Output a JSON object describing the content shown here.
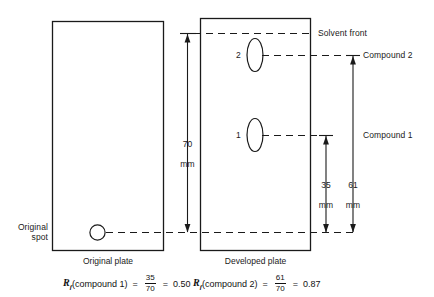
{
  "figure": {
    "type": "thin-layer-chromatography-diagram",
    "plates": [
      {
        "id": "original",
        "caption": "Original plate",
        "spots": [
          {
            "id": "original-spot",
            "label": "",
            "shape": "circle"
          }
        ]
      },
      {
        "id": "developed",
        "caption": "Developed plate",
        "spots": [
          {
            "id": "spot-2",
            "label": "2",
            "shape": "ellipse"
          },
          {
            "id": "spot-1",
            "label": "1",
            "shape": "ellipse"
          }
        ]
      }
    ],
    "annotations": {
      "original_spot": "Original\nspot",
      "solvent_front": "Solvent front",
      "compound_2": "Compound 2",
      "compound_1": "Compound 1"
    },
    "dimensions": [
      {
        "id": "dim-70",
        "value": "70",
        "unit": "mm"
      },
      {
        "id": "dim-35",
        "value": "35",
        "unit": "mm"
      },
      {
        "id": "dim-61",
        "value": "61",
        "unit": "mm"
      }
    ],
    "equations": [
      {
        "id": "rf-compound-1",
        "symbol": "R",
        "subscript": "f",
        "argument": "(compound 1)",
        "equals": "=",
        "numerator": "35",
        "denominator": "70",
        "equals2": "=",
        "result": "0.50"
      },
      {
        "id": "rf-compound-2",
        "symbol": "R",
        "subscript": "f",
        "argument": "(compound 2)",
        "equals": "=",
        "numerator": "61",
        "denominator": "70",
        "equals2": "=",
        "result": "0.87"
      }
    ],
    "colors": {
      "stroke": "#1a1a1a",
      "background": "#ffffff"
    }
  }
}
